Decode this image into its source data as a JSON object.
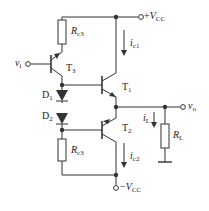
{
  "diagram": {
    "type": "circuit-schematic",
    "colors": {
      "line": "#333333",
      "background": "#ffffff"
    },
    "labels": {
      "vcc_pos": {
        "prefix": "+",
        "main": "V",
        "sub": "CC"
      },
      "vcc_neg": {
        "prefix": "−",
        "main": "V",
        "sub": "CC"
      },
      "vi": {
        "main": "v",
        "sub": "i"
      },
      "vo": {
        "main": "v",
        "sub": "o"
      },
      "rc3_top": {
        "main": "R",
        "sub": "c3"
      },
      "rc3_bottom": {
        "main": "R",
        "sub": "c3"
      },
      "rl": {
        "main": "R",
        "sub": "L"
      },
      "t3": {
        "main": "T",
        "sub": "3"
      },
      "t1": {
        "main": "T",
        "sub": "1"
      },
      "t2": {
        "main": "T",
        "sub": "2"
      },
      "d1": {
        "main": "D",
        "sub": "1"
      },
      "d2": {
        "main": "D",
        "sub": "2"
      },
      "ic1": {
        "main": "i",
        "sub": "c1"
      },
      "ic2": {
        "main": "i",
        "sub": "c2"
      },
      "il": {
        "main": "i",
        "sub": "L"
      }
    },
    "components": [
      {
        "id": "T3",
        "kind": "PNP transistor"
      },
      {
        "id": "T1",
        "kind": "NPN transistor"
      },
      {
        "id": "T2",
        "kind": "PNP transistor"
      },
      {
        "id": "D1",
        "kind": "diode"
      },
      {
        "id": "D2",
        "kind": "diode"
      },
      {
        "id": "Rc3_top",
        "kind": "resistor"
      },
      {
        "id": "Rc3_bottom",
        "kind": "resistor"
      },
      {
        "id": "RL",
        "kind": "load resistor"
      }
    ]
  }
}
